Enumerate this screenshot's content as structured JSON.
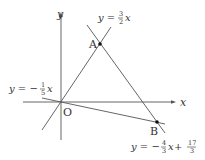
{
  "diagram": {
    "colors": {
      "line": "#555555",
      "text": "#333333",
      "point": "#111111"
    },
    "axes": {
      "x_label": "x",
      "y_label": "y",
      "origin_label": "O"
    },
    "lines": [
      {
        "id": "line-a",
        "equation_lhs": "y = ",
        "coef_num": "3",
        "coef_den": "2",
        "var": "x",
        "sign": ""
      },
      {
        "id": "line-c",
        "equation_lhs": "y = −",
        "coef_num": "1",
        "coef_den": "5",
        "var": "x",
        "sign": "-"
      },
      {
        "id": "line-b",
        "equation_lhs": "y = −",
        "coef_num": "4",
        "coef_den": "3",
        "var": "x",
        "plus": " + ",
        "const_num": "17",
        "const_den": "3"
      }
    ],
    "points": [
      {
        "label": "A"
      },
      {
        "label": "B"
      }
    ]
  }
}
